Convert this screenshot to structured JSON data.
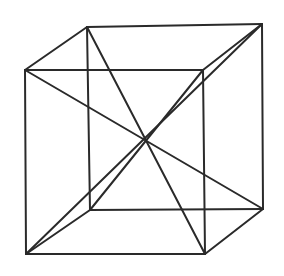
{
  "diagram": {
    "stroke_color": "#2a2a2a",
    "background": "#ffffff",
    "stroke_width": 2,
    "vertices": {
      "front_top_left": [
        25,
        70
      ],
      "front_top_right": [
        203,
        70
      ],
      "front_bottom_left": [
        26,
        254
      ],
      "front_bottom_right": [
        205,
        254
      ],
      "back_top_left": [
        87,
        27
      ],
      "back_top_right": [
        262,
        24
      ],
      "back_bottom_left": [
        90,
        210
      ],
      "back_bottom_right": [
        263,
        209
      ]
    },
    "edges": [
      {
        "name": "front-top-edge",
        "from": "front_top_left",
        "to": "front_top_right"
      },
      {
        "name": "front-bottom-edge",
        "from": "front_bottom_left",
        "to": "front_bottom_right"
      },
      {
        "name": "front-left-edge",
        "from": "front_top_left",
        "to": "front_bottom_left"
      },
      {
        "name": "front-right-edge",
        "from": "front_top_right",
        "to": "front_bottom_right"
      },
      {
        "name": "back-top-edge",
        "from": "back_top_left",
        "to": "back_top_right"
      },
      {
        "name": "back-bottom-edge",
        "from": "back_bottom_left",
        "to": "back_bottom_right"
      },
      {
        "name": "back-left-edge",
        "from": "back_top_left",
        "to": "back_bottom_left"
      },
      {
        "name": "back-right-edge",
        "from": "back_top_right",
        "to": "back_bottom_right"
      },
      {
        "name": "top-left-connector",
        "from": "front_top_left",
        "to": "back_top_left"
      },
      {
        "name": "top-right-connector",
        "from": "front_top_right",
        "to": "back_top_right"
      },
      {
        "name": "bottom-left-connector",
        "from": "front_bottom_left",
        "to": "back_bottom_left"
      },
      {
        "name": "bottom-right-connector",
        "from": "front_bottom_right",
        "to": "back_bottom_right"
      }
    ],
    "diagonals": [
      {
        "name": "diagonal-ftl-bbr",
        "from": "front_top_left",
        "to": "back_bottom_right"
      },
      {
        "name": "diagonal-btl-fbr",
        "from": "back_top_left",
        "to": "front_bottom_right"
      },
      {
        "name": "diagonal-btr-fbl",
        "from": "back_top_right",
        "to": "front_bottom_left"
      },
      {
        "name": "diagonal-ftr-bbl",
        "from": "front_top_right",
        "to": "back_bottom_left"
      }
    ],
    "center_intersection": [
      150,
      139
    ]
  }
}
